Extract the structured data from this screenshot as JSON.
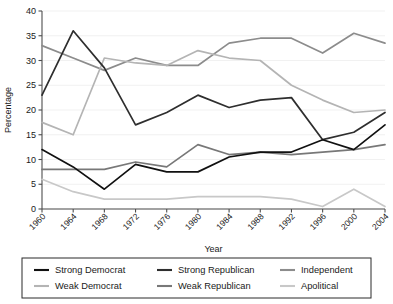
{
  "chart_data": {
    "type": "line",
    "title": "",
    "xlabel": "Year",
    "ylabel": "Percentage",
    "x": [
      1960,
      1964,
      1968,
      1972,
      1976,
      1980,
      1984,
      1988,
      1992,
      1996,
      2000,
      2004
    ],
    "xtick_labels": [
      "1960",
      "1964",
      "1968",
      "1972",
      "1976",
      "1980",
      "1984",
      "1988",
      "1992",
      "1996",
      "2000",
      "2004"
    ],
    "ytick_labels": [
      "0",
      "5",
      "10",
      "15",
      "20",
      "25",
      "30",
      "35",
      "40"
    ],
    "yticks": [
      0,
      5,
      10,
      15,
      20,
      25,
      30,
      35,
      40
    ],
    "ylim": [
      0,
      40
    ],
    "xlim": [
      1960,
      2004
    ],
    "grid": true,
    "grid_axis": "y",
    "legend_position": "bottom",
    "series": [
      {
        "name": "Strong Democrat",
        "color": "#111111",
        "values": [
          12.0,
          8.5,
          4.0,
          9.0,
          7.5,
          7.5,
          10.5,
          11.5,
          11.5,
          14.0,
          12.0,
          17.0
        ]
      },
      {
        "name": "Weak Democrat",
        "color": "#b4b4b4",
        "values": [
          17.5,
          15.0,
          30.5,
          29.5,
          29.0,
          32.0,
          30.5,
          30.0,
          25.0,
          22.0,
          19.5,
          20.0
        ]
      },
      {
        "name": "Strong Republican",
        "color": "#2e2e2e",
        "values": [
          23.0,
          36.0,
          28.5,
          17.0,
          19.5,
          23.0,
          20.5,
          22.0,
          22.5,
          14.0,
          15.5,
          19.5
        ]
      },
      {
        "name": "Weak Republican",
        "color": "#787878",
        "values": [
          8.0,
          8.0,
          8.0,
          9.5,
          8.5,
          13.0,
          11.0,
          11.5,
          11.0,
          11.5,
          12.0,
          13.0
        ]
      },
      {
        "name": "Independent",
        "color": "#8c8c8c",
        "values": [
          33.0,
          30.5,
          28.0,
          30.5,
          29.0,
          29.0,
          33.5,
          34.5,
          34.5,
          31.5,
          35.5,
          33.5
        ]
      },
      {
        "name": "Apolitical",
        "color": "#c8c8c8",
        "values": [
          6.0,
          3.5,
          2.0,
          2.0,
          2.0,
          2.5,
          2.5,
          2.5,
          2.0,
          0.5,
          4.0,
          0.5
        ]
      }
    ]
  },
  "legend": {
    "entries": [
      {
        "label": "Strong Democrat",
        "color": "#111111"
      },
      {
        "label": "Strong Republican",
        "color": "#2e2e2e"
      },
      {
        "label": "Independent",
        "color": "#8c8c8c"
      },
      {
        "label": "Weak Democrat",
        "color": "#b4b4b4"
      },
      {
        "label": "Weak Republican",
        "color": "#787878"
      },
      {
        "label": "Apolitical",
        "color": "#c8c8c8"
      }
    ]
  }
}
